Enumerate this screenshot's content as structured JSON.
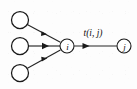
{
  "figure": {
    "background_color": "#fdfdfd",
    "stroke_color": "#1a1a1a",
    "node_fill": "#ffffff"
  },
  "nodes": [
    {
      "id": "src1",
      "label": "",
      "cx": 20,
      "cy": 20,
      "r": 8.5
    },
    {
      "id": "src2",
      "label": "",
      "cx": 20,
      "cy": 46,
      "r": 8.5
    },
    {
      "id": "src3",
      "label": "",
      "cx": 20,
      "cy": 73,
      "r": 8.5
    },
    {
      "id": "i",
      "label": "i",
      "cx": 67,
      "cy": 46,
      "r": 7.0
    },
    {
      "id": "j",
      "label": "j",
      "cx": 124,
      "cy": 46,
      "r": 7.0
    }
  ],
  "edges": [
    {
      "id": "e1",
      "from": "src1",
      "to": "i",
      "label": ""
    },
    {
      "id": "e2",
      "from": "src2",
      "to": "i",
      "label": ""
    },
    {
      "id": "e3",
      "from": "src3",
      "to": "i",
      "label": ""
    },
    {
      "id": "e4",
      "from": "i",
      "to": "j",
      "label": "t(i, j)"
    }
  ],
  "labels": {
    "node_i": "i",
    "node_j": "j",
    "edge_transition": "t(i, j)"
  }
}
